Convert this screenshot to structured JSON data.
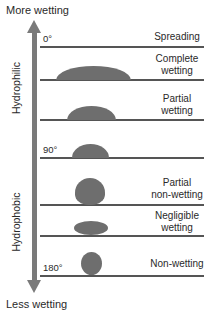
{
  "axis": {
    "top_label": "More wetting",
    "bottom_label": "Less wetting",
    "upper_region": "Hydrophilic",
    "lower_region": "Hydrophobic",
    "arrow_color": "#7a7a7a"
  },
  "angles": [
    {
      "label": "0°"
    },
    {
      "label": "90°"
    },
    {
      "label": "180°"
    }
  ],
  "states": [
    {
      "line1": "Spreading",
      "line2": ""
    },
    {
      "line1": "Complete",
      "line2": "wetting"
    },
    {
      "line1": "Partial",
      "line2": "wetting"
    },
    {
      "line1": "Partial",
      "line2": "non-wetting"
    },
    {
      "line1": "Negligible",
      "line2": "wetting"
    },
    {
      "line1": "Non-wetting",
      "line2": ""
    }
  ],
  "colors": {
    "droplet": "#6e6e6e",
    "line": "#555555",
    "text": "#2a2a2a"
  }
}
